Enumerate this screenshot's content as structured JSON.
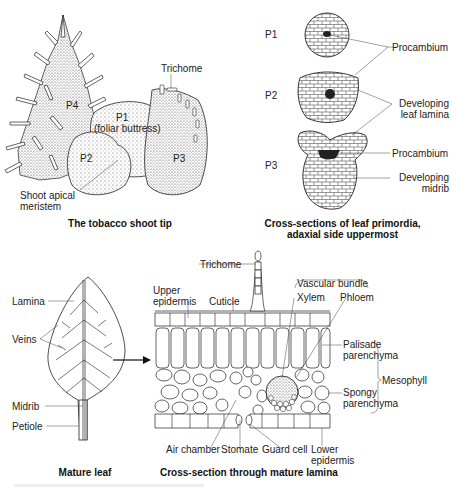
{
  "panels": {
    "shoot_tip": {
      "caption": "The tobacco shoot tip",
      "labels": {
        "p4": "P4",
        "p1": "P1",
        "p1_note": "(foliar buttress)",
        "p2": "P2",
        "p3": "P3",
        "trichome": "Trichome",
        "meristem_line1": "Shoot apical",
        "meristem_line2": "meristem"
      }
    },
    "primordia": {
      "caption_line1": "Cross-sections of leaf primordia,",
      "caption_line2": "adaxial side uppermost",
      "labels": {
        "p1": "P1",
        "p2": "P2",
        "p3": "P3",
        "procambium_1": "Procambium",
        "lamina_line1": "Developing",
        "lamina_line2": "leaf lamina",
        "procambium_2": "Procambium",
        "midrib_line1": "Developing",
        "midrib_line2": "midrib"
      }
    },
    "mature_leaf": {
      "caption": "Mature leaf",
      "labels": {
        "lamina": "Lamina",
        "veins": "Veins",
        "midrib": "Midrib",
        "petiole": "Petiole"
      }
    },
    "lamina_section": {
      "caption": "Cross-section through mature lamina",
      "labels": {
        "trichome": "Trichome",
        "upper_line1": "Upper",
        "upper_line2": "epidermis",
        "cuticle": "Cuticle",
        "vascular_bundle": "Vascular bundle",
        "xylem": "Xylem",
        "phloem": "Phloem",
        "palisade_line1": "Palisade",
        "palisade_line2": "parenchyma",
        "mesophyll": "Mesophyll",
        "spongy_line1": "Spongy",
        "spongy_line2": "parenchyma",
        "air_chamber": "Air chamber",
        "stomate": "Stomate",
        "guard_cell": "Guard cell",
        "lower_line1": "Lower",
        "lower_line2": "epidermis"
      }
    }
  },
  "colors": {
    "ink": "#1a1a1a",
    "stipple": "#555555",
    "dark_fill": "#222222"
  }
}
